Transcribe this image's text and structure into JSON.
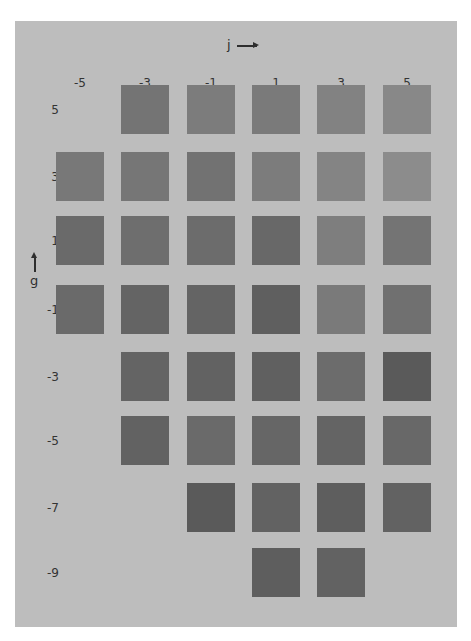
{
  "chart_data": {
    "type": "heatmap",
    "title": "",
    "xlabel": "j",
    "ylabel": "g",
    "x_ticks": [
      "-5",
      "-3",
      "-1",
      "1",
      "3",
      "5"
    ],
    "y_ticks": [
      "5",
      "3",
      "1",
      "-1",
      "-3",
      "-5",
      "-7",
      "-9"
    ],
    "grid": false,
    "legend": null,
    "background": "#bdbdbd",
    "note": "Grey-level squares; values are grey intensities (0=black,255=white); null = no square",
    "cells": [
      {
        "g": 5,
        "values": [
          null,
          116,
          124,
          122,
          130,
          136
        ]
      },
      {
        "g": 3,
        "values": [
          120,
          118,
          114,
          124,
          132,
          140
        ]
      },
      {
        "g": 1,
        "values": [
          106,
          110,
          108,
          104,
          126,
          116
        ]
      },
      {
        "g": -1,
        "values": [
          106,
          100,
          100,
          95,
          122,
          112
        ]
      },
      {
        "g": -3,
        "values": [
          null,
          100,
          98,
          96,
          108,
          90
        ]
      },
      {
        "g": -5,
        "values": [
          null,
          98,
          106,
          102,
          100,
          104
        ]
      },
      {
        "g": -7,
        "values": [
          null,
          null,
          90,
          98,
          94,
          98
        ]
      },
      {
        "g": -9,
        "values": [
          null,
          null,
          null,
          94,
          98,
          null
        ]
      }
    ]
  },
  "axes": {
    "x_title": "j",
    "y_title": "g"
  },
  "col_labels": [
    "-5",
    "-3",
    "-1",
    "1",
    "3",
    "5"
  ],
  "row_labels": [
    "5",
    "3",
    "1",
    "-1",
    "-3",
    "-5",
    "-7",
    "-9"
  ],
  "squares": [
    {
      "col": 1,
      "row": 0,
      "color": "#747474"
    },
    {
      "col": 2,
      "row": 0,
      "color": "#7c7c7c"
    },
    {
      "col": 3,
      "row": 0,
      "color": "#7a7a7a"
    },
    {
      "col": 4,
      "row": 0,
      "color": "#828282"
    },
    {
      "col": 5,
      "row": 0,
      "color": "#888888"
    },
    {
      "col": 0,
      "row": 1,
      "color": "#787878"
    },
    {
      "col": 1,
      "row": 1,
      "color": "#767676"
    },
    {
      "col": 2,
      "row": 1,
      "color": "#727272"
    },
    {
      "col": 3,
      "row": 1,
      "color": "#7c7c7c"
    },
    {
      "col": 4,
      "row": 1,
      "color": "#848484"
    },
    {
      "col": 5,
      "row": 1,
      "color": "#8c8c8c"
    },
    {
      "col": 0,
      "row": 2,
      "color": "#6a6a6a"
    },
    {
      "col": 1,
      "row": 2,
      "color": "#6e6e6e"
    },
    {
      "col": 2,
      "row": 2,
      "color": "#6c6c6c"
    },
    {
      "col": 3,
      "row": 2,
      "color": "#686868"
    },
    {
      "col": 4,
      "row": 2,
      "color": "#7e7e7e"
    },
    {
      "col": 5,
      "row": 2,
      "color": "#747474"
    },
    {
      "col": 0,
      "row": 3,
      "color": "#6a6a6a"
    },
    {
      "col": 1,
      "row": 3,
      "color": "#646464"
    },
    {
      "col": 2,
      "row": 3,
      "color": "#646464"
    },
    {
      "col": 3,
      "row": 3,
      "color": "#5f5f5f"
    },
    {
      "col": 4,
      "row": 3,
      "color": "#7a7a7a"
    },
    {
      "col": 5,
      "row": 3,
      "color": "#707070"
    },
    {
      "col": 1,
      "row": 4,
      "color": "#646464"
    },
    {
      "col": 2,
      "row": 4,
      "color": "#626262"
    },
    {
      "col": 3,
      "row": 4,
      "color": "#606060"
    },
    {
      "col": 4,
      "row": 4,
      "color": "#6c6c6c"
    },
    {
      "col": 5,
      "row": 4,
      "color": "#5a5a5a"
    },
    {
      "col": 1,
      "row": 5,
      "color": "#626262"
    },
    {
      "col": 2,
      "row": 5,
      "color": "#6a6a6a"
    },
    {
      "col": 3,
      "row": 5,
      "color": "#666666"
    },
    {
      "col": 4,
      "row": 5,
      "color": "#646464"
    },
    {
      "col": 5,
      "row": 5,
      "color": "#686868"
    },
    {
      "col": 2,
      "row": 6,
      "color": "#5a5a5a"
    },
    {
      "col": 3,
      "row": 6,
      "color": "#626262"
    },
    {
      "col": 4,
      "row": 6,
      "color": "#5e5e5e"
    },
    {
      "col": 5,
      "row": 6,
      "color": "#626262"
    },
    {
      "col": 3,
      "row": 7,
      "color": "#5e5e5e"
    },
    {
      "col": 4,
      "row": 7,
      "color": "#626262"
    }
  ]
}
